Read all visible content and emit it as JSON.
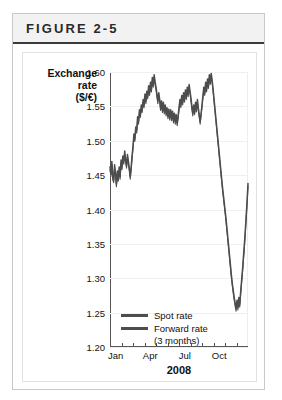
{
  "figure": {
    "title": "FIGURE 2-5"
  },
  "chart_data": {
    "type": "line",
    "title": "",
    "xlabel": "2008",
    "ylabel": "Exchange rate ($/€)",
    "ylabel_lines": [
      "Exchange",
      "rate",
      "($/€)"
    ],
    "ylim": [
      1.2,
      1.6
    ],
    "yticks": [
      1.6,
      1.55,
      1.5,
      1.45,
      1.4,
      1.35,
      1.3,
      1.25,
      1.2
    ],
    "ytick_labels": [
      "1.60",
      "1.55",
      "1.50",
      "1.45",
      "1.40",
      "1.35",
      "1.30",
      "1.25",
      "1.20"
    ],
    "grid": true,
    "legend_position": "inside-bottom-left",
    "xlim": [
      0,
      12
    ],
    "xticks": [
      0,
      1,
      2,
      3,
      4,
      5,
      6,
      7,
      8,
      9,
      10,
      11
    ],
    "xtick_labels": [
      {
        "pos": 0.5,
        "label": "Jan"
      },
      {
        "pos": 3.5,
        "label": "Apr"
      },
      {
        "pos": 6.5,
        "label": "Jul"
      },
      {
        "pos": 9.5,
        "label": "Oct"
      }
    ],
    "colors": {
      "spot": "#4d4d4d",
      "forward": "#4d4d4d",
      "axis": "#555555",
      "grid": "#f0f0f0"
    },
    "series": [
      {
        "name": "Spot rate",
        "legend_label": "Spot rate",
        "color": "#4d4d4d",
        "x": [
          0.0,
          0.08,
          0.16,
          0.24,
          0.32,
          0.4,
          0.48,
          0.56,
          0.64,
          0.72,
          0.8,
          0.88,
          0.96,
          1.04,
          1.12,
          1.2,
          1.28,
          1.36,
          1.44,
          1.52,
          1.6,
          1.68,
          1.76,
          1.84,
          1.92,
          2.0,
          2.08,
          2.16,
          2.24,
          2.32,
          2.4,
          2.48,
          2.56,
          2.64,
          2.72,
          2.8,
          2.88,
          2.96,
          3.04,
          3.12,
          3.2,
          3.28,
          3.36,
          3.44,
          3.52,
          3.6,
          3.68,
          3.76,
          3.84,
          3.92,
          4.0,
          4.08,
          4.16,
          4.24,
          4.32,
          4.4,
          4.48,
          4.56,
          4.64,
          4.72,
          4.8,
          4.88,
          4.96,
          5.04,
          5.12,
          5.2,
          5.28,
          5.36,
          5.44,
          5.52,
          5.6,
          5.68,
          5.76,
          5.84,
          5.92,
          6.0,
          6.08,
          6.16,
          6.24,
          6.32,
          6.4,
          6.48,
          6.56,
          6.64,
          6.72,
          6.8,
          6.88,
          6.96,
          7.04,
          7.12,
          7.2,
          7.28,
          7.36,
          7.44,
          7.52,
          7.6,
          7.68,
          7.76,
          7.84,
          7.92,
          8.0,
          8.08,
          8.16,
          8.24,
          8.32,
          8.4,
          8.48,
          8.56,
          8.64,
          8.72,
          8.8,
          8.88,
          8.96,
          9.04,
          9.12,
          9.2,
          9.28,
          9.36,
          9.44,
          9.52,
          9.6,
          9.68,
          9.76,
          9.84,
          9.92,
          10.0,
          10.08,
          10.16,
          10.24,
          10.32,
          10.4,
          10.48,
          10.56,
          10.64,
          10.72,
          10.8,
          10.88,
          10.96,
          11.04,
          11.12,
          11.2,
          11.28,
          11.36,
          11.44,
          11.52,
          11.6,
          11.68,
          11.76,
          11.84,
          11.92,
          12.0
        ],
        "values": [
          1.462,
          1.452,
          1.47,
          1.447,
          1.443,
          1.465,
          1.452,
          1.437,
          1.456,
          1.445,
          1.462,
          1.448,
          1.472,
          1.462,
          1.478,
          1.47,
          1.485,
          1.472,
          1.464,
          1.48,
          1.47,
          1.46,
          1.448,
          1.462,
          1.478,
          1.492,
          1.51,
          1.503,
          1.52,
          1.515,
          1.535,
          1.528,
          1.545,
          1.538,
          1.552,
          1.545,
          1.56,
          1.552,
          1.568,
          1.558,
          1.572,
          1.565,
          1.58,
          1.57,
          1.585,
          1.575,
          1.592,
          1.582,
          1.596,
          1.586,
          1.578,
          1.568,
          1.558,
          1.57,
          1.56,
          1.548,
          1.558,
          1.545,
          1.556,
          1.543,
          1.552,
          1.54,
          1.548,
          1.536,
          1.546,
          1.534,
          1.545,
          1.533,
          1.543,
          1.53,
          1.54,
          1.528,
          1.538,
          1.526,
          1.536,
          1.548,
          1.56,
          1.552,
          1.566,
          1.556,
          1.57,
          1.56,
          1.574,
          1.564,
          1.578,
          1.568,
          1.582,
          1.572,
          1.562,
          1.55,
          1.54,
          1.552,
          1.542,
          1.556,
          1.546,
          1.56,
          1.548,
          1.538,
          1.528,
          1.54,
          1.552,
          1.566,
          1.578,
          1.57,
          1.585,
          1.575,
          1.59,
          1.58,
          1.596,
          1.586,
          1.598,
          1.588,
          1.576,
          1.562,
          1.548,
          1.534,
          1.52,
          1.506,
          1.492,
          1.478,
          1.464,
          1.45,
          1.436,
          1.424,
          1.412,
          1.4,
          1.388,
          1.374,
          1.36,
          1.346,
          1.332,
          1.318,
          1.304,
          1.292,
          1.282,
          1.272,
          1.264,
          1.256,
          1.268,
          1.258,
          1.272,
          1.262,
          1.28,
          1.296,
          1.312,
          1.33,
          1.348,
          1.368,
          1.39,
          1.412,
          1.438
        ]
      },
      {
        "name": "Forward rate (3 months)",
        "legend_label": "Forward rate",
        "legend_sublabel": "(3 months)",
        "color": "#4d4d4d",
        "x": [
          0.0,
          0.08,
          0.16,
          0.24,
          0.32,
          0.4,
          0.48,
          0.56,
          0.64,
          0.72,
          0.8,
          0.88,
          0.96,
          1.04,
          1.12,
          1.2,
          1.28,
          1.36,
          1.44,
          1.52,
          1.6,
          1.68,
          1.76,
          1.84,
          1.92,
          2.0,
          2.08,
          2.16,
          2.24,
          2.32,
          2.4,
          2.48,
          2.56,
          2.64,
          2.72,
          2.8,
          2.88,
          2.96,
          3.04,
          3.12,
          3.2,
          3.28,
          3.36,
          3.44,
          3.52,
          3.6,
          3.68,
          3.76,
          3.84,
          3.92,
          4.0,
          4.08,
          4.16,
          4.24,
          4.32,
          4.4,
          4.48,
          4.56,
          4.64,
          4.72,
          4.8,
          4.88,
          4.96,
          5.04,
          5.12,
          5.2,
          5.28,
          5.36,
          5.44,
          5.52,
          5.6,
          5.68,
          5.76,
          5.84,
          5.92,
          6.0,
          6.08,
          6.16,
          6.24,
          6.32,
          6.4,
          6.48,
          6.56,
          6.64,
          6.72,
          6.8,
          6.88,
          6.96,
          7.04,
          7.12,
          7.2,
          7.28,
          7.36,
          7.44,
          7.52,
          7.6,
          7.68,
          7.76,
          7.84,
          7.92,
          8.0,
          8.08,
          8.16,
          8.24,
          8.32,
          8.4,
          8.48,
          8.56,
          8.64,
          8.72,
          8.8,
          8.88,
          8.96,
          9.04,
          9.12,
          9.2,
          9.28,
          9.36,
          9.44,
          9.52,
          9.6,
          9.68,
          9.76,
          9.84,
          9.92,
          10.0,
          10.08,
          10.16,
          10.24,
          10.32,
          10.4,
          10.48,
          10.56,
          10.64,
          10.72,
          10.8,
          10.88,
          10.96,
          11.04,
          11.12,
          11.2,
          11.28,
          11.36,
          11.44,
          11.52,
          11.6,
          11.68,
          11.76,
          11.84,
          11.92,
          12.0
        ],
        "values": [
          1.458,
          1.448,
          1.466,
          1.443,
          1.439,
          1.461,
          1.448,
          1.433,
          1.452,
          1.441,
          1.458,
          1.444,
          1.468,
          1.458,
          1.474,
          1.466,
          1.481,
          1.468,
          1.46,
          1.476,
          1.466,
          1.456,
          1.444,
          1.458,
          1.474,
          1.488,
          1.506,
          1.499,
          1.516,
          1.511,
          1.531,
          1.524,
          1.541,
          1.534,
          1.548,
          1.541,
          1.556,
          1.548,
          1.564,
          1.554,
          1.568,
          1.561,
          1.576,
          1.566,
          1.581,
          1.571,
          1.588,
          1.578,
          1.592,
          1.582,
          1.574,
          1.564,
          1.554,
          1.566,
          1.556,
          1.544,
          1.554,
          1.541,
          1.552,
          1.539,
          1.548,
          1.536,
          1.544,
          1.532,
          1.542,
          1.53,
          1.541,
          1.529,
          1.539,
          1.526,
          1.536,
          1.524,
          1.534,
          1.522,
          1.532,
          1.544,
          1.556,
          1.548,
          1.562,
          1.552,
          1.566,
          1.556,
          1.57,
          1.56,
          1.574,
          1.564,
          1.578,
          1.568,
          1.558,
          1.546,
          1.536,
          1.548,
          1.538,
          1.552,
          1.542,
          1.556,
          1.544,
          1.534,
          1.524,
          1.536,
          1.548,
          1.562,
          1.574,
          1.566,
          1.581,
          1.571,
          1.586,
          1.576,
          1.592,
          1.582,
          1.594,
          1.584,
          1.572,
          1.558,
          1.544,
          1.53,
          1.516,
          1.502,
          1.488,
          1.474,
          1.46,
          1.446,
          1.432,
          1.42,
          1.408,
          1.396,
          1.384,
          1.37,
          1.356,
          1.342,
          1.328,
          1.314,
          1.3,
          1.288,
          1.278,
          1.268,
          1.26,
          1.252,
          1.264,
          1.254,
          1.268,
          1.258,
          1.276,
          1.292,
          1.308,
          1.326,
          1.344,
          1.364,
          1.386,
          1.408,
          1.434
        ]
      }
    ]
  }
}
